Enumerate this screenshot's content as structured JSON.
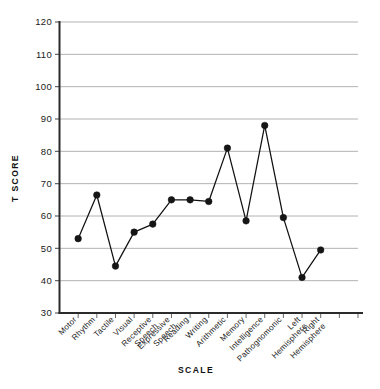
{
  "chart_data": {
    "type": "line",
    "title": "",
    "xlabel": "SCALE",
    "ylabel": "T SCORE",
    "ylim": [
      30,
      120
    ],
    "yticks": [
      30,
      40,
      50,
      60,
      70,
      80,
      90,
      100,
      110,
      120
    ],
    "grid": true,
    "legend": "none",
    "marker": "filled-circle",
    "line_color": "#151515",
    "marker_color": "#151515",
    "grid_color": "#a9a9a9",
    "axis_color": "#2b2b2b",
    "categories": [
      "Motor",
      "Rhythm",
      "Tactile",
      "Visual",
      "Receptive Speech",
      "Expressive Speech",
      "Reading",
      "Writing",
      "Arithmetic",
      "Memory",
      "Intelligence",
      "Pathognomonic",
      "Left Hemisphere",
      "Right Hemisphere"
    ],
    "values": [
      53,
      66.5,
      44.5,
      55,
      57.5,
      65,
      65,
      64.5,
      81,
      58.5,
      88,
      59.5,
      41,
      49.5
    ],
    "series": [
      {
        "name": "T Score Profile",
        "values": [
          53,
          66.5,
          44.5,
          55,
          57.5,
          65,
          65,
          64.5,
          81,
          58.5,
          88,
          59.5,
          41,
          49.5
        ]
      }
    ]
  },
  "axes": {
    "y_title": "T SCORE",
    "x_title": "SCALE"
  }
}
